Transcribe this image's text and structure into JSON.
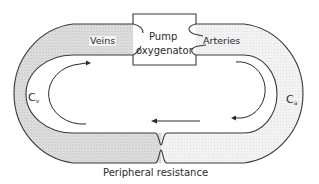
{
  "diagram": {
    "type": "circulatory-model",
    "labels": {
      "veins": "Veins",
      "arteries": "Arteries",
      "pump_line1": "Pump",
      "pump_line2": "oxygenator",
      "venous_capacitance_main": "C",
      "venous_capacitance_sub": "v",
      "arterial_capacitance_main": "C",
      "arterial_capacitance_sub": "a",
      "peripheral_resistance": "Peripheral resistance"
    },
    "components": [
      {
        "name": "Veins",
        "compliance": "Cv",
        "side": "left"
      },
      {
        "name": "Pump oxygenator",
        "position": "top-center"
      },
      {
        "name": "Arteries",
        "compliance": "Ca",
        "side": "right"
      },
      {
        "name": "Peripheral resistance",
        "position": "bottom-center"
      }
    ],
    "flow_direction": "clockwise",
    "colors": {
      "stroke": "#3a3a3a",
      "venous_fill": "#d6d6d6",
      "arterial_fill": "#ececec",
      "background": "#ffffff"
    }
  }
}
